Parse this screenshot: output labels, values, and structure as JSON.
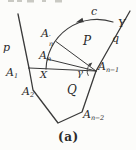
{
  "figure": {
    "type": "geometry-diagram",
    "caption": "(a)",
    "colors": {
      "background": "#fcfcfa",
      "line": "#3a3a3a",
      "text": "#2b2b2b",
      "faint": "#c9c9c3"
    },
    "labels": {
      "p": "p",
      "c": "c",
      "Y": "Y",
      "q": "q",
      "P": "P",
      "Q": "Q",
      "X": "X",
      "gamma": "γ",
      "A1": {
        "base": "A",
        "sub": "1"
      },
      "A2": {
        "base": "A",
        "sub": "2"
      },
      "An_prime": {
        "base": "A",
        "prime": "′",
        "sub": "n"
      },
      "An": {
        "base": "A",
        "sub": "n"
      },
      "An1": {
        "base": "A",
        "sub": "n−1"
      },
      "An2": {
        "base": "A",
        "sub": "n−2"
      }
    }
  }
}
